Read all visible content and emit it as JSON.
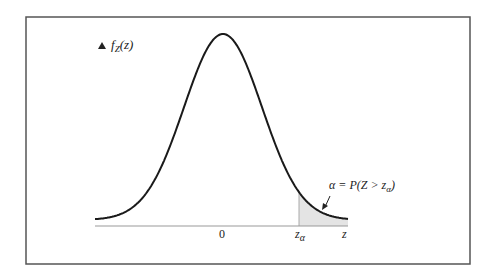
{
  "chart_data": {
    "type": "area",
    "title": "",
    "ylabel": "f_Z(z)",
    "xlabel": "z",
    "tick_labels": [
      "0",
      "z_α"
    ],
    "annotation": "α = P(Z > z_α)",
    "curve": "standard normal density",
    "shaded_region": {
      "from": "z_α",
      "to": "+∞",
      "label": "α"
    }
  },
  "labels": {
    "y_axis": "f",
    "y_axis_sub": "Z",
    "y_axis_arg": "(z)",
    "zero": "0",
    "z_alpha": "z",
    "z_alpha_sub": "α",
    "z_end": "z",
    "annotation_main": "α = P(Z > z",
    "annotation_sub": "α",
    "annotation_close": ")"
  },
  "colors": {
    "frame": "#555555",
    "curve": "#1a1a1a",
    "axis": "#999999",
    "shade": "#e4e4e4"
  }
}
